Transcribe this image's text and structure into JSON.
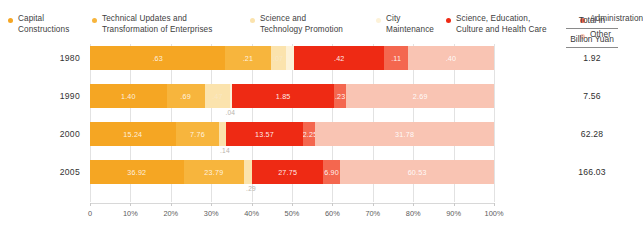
{
  "legend": {
    "items": [
      {
        "label": "Capital\nConstructions",
        "color": "#f5a623",
        "icon": "legend-dot"
      },
      {
        "label": "Technical Updates and\nTransformation of Enterprises",
        "color": "#f7b53d",
        "icon": "legend-dot"
      },
      {
        "label": "Science and\nTechnology Promotion",
        "color": "#fbe3ad",
        "icon": "legend-dot"
      },
      {
        "label": "City\nMaintenance",
        "color": "#fdf2d8",
        "icon": "legend-dot"
      },
      {
        "label": "Science, Education,\nCulture and Health Care",
        "color": "#ee2a14",
        "icon": "legend-dot"
      },
      {
        "label": "Administration",
        "color": "#f4674f",
        "icon": "legend-dot"
      },
      {
        "label": "Other",
        "color": "#f9c4b3",
        "icon": "legend-dot"
      }
    ]
  },
  "total_header": {
    "line1": "Total in",
    "line2": "Billion Yuan"
  },
  "axis": {
    "ticks": [
      "0",
      "10%",
      "20%",
      "30%",
      "40%",
      "50%",
      "60%",
      "70%",
      "80%",
      "90%",
      "100%"
    ],
    "values": [
      0,
      10,
      20,
      30,
      40,
      50,
      60,
      70,
      80,
      90,
      100
    ]
  },
  "chart_data": {
    "type": "bar",
    "subtype": "100% stacked horizontal bar",
    "title": "",
    "xlabel": "",
    "ylabel": "",
    "xlim": [
      0,
      100
    ],
    "grid": true,
    "legend_position": "top",
    "units": "Billion Yuan",
    "categories": [
      "1980",
      "1990",
      "2000",
      "2005"
    ],
    "series": [
      {
        "name": "Capital Constructions",
        "color": "#f5a623",
        "values": [
          0.63,
          1.4,
          15.24,
          36.92
        ],
        "labels": [
          ".63",
          "1.40",
          "15.24",
          "36.92"
        ]
      },
      {
        "name": "Technical Updates and Transformation of Enterprises",
        "color": "#f7b53d",
        "values": [
          0.21,
          0.69,
          7.76,
          23.79
        ],
        "labels": [
          ".21",
          ".69",
          "7.76",
          "23.79"
        ]
      },
      {
        "name": "Science and Technology Promotion",
        "color": "#fbe3ad",
        "values": [
          0.07,
          0.47,
          1.13,
          3.03
        ],
        "labels": [
          ".07",
          ".47",
          "1.13",
          "3.03"
        ]
      },
      {
        "name": "City Maintenance",
        "color": "#fdf2d8",
        "values": [
          0.04,
          0.04,
          0.14,
          0.29
        ],
        "labels": [
          "",
          ".04",
          ".14",
          ".29"
        ]
      },
      {
        "name": "Science, Education, Culture and Health Care",
        "color": "#ee2a14",
        "values": [
          0.42,
          1.85,
          13.57,
          27.75
        ],
        "labels": [
          ".42",
          "1.85",
          "13.57",
          "27.75"
        ]
      },
      {
        "name": "Administration",
        "color": "#f4674f",
        "values": [
          0.11,
          0.23,
          2.25,
          6.9
        ],
        "labels": [
          ".11",
          ".23",
          "2.25",
          "6.90"
        ]
      },
      {
        "name": "Other",
        "color": "#f9c4b3",
        "values": [
          0.4,
          2.69,
          31.78,
          60.53
        ],
        "labels": [
          ".40",
          "2.69",
          "31.78",
          "60.53"
        ]
      }
    ],
    "totals": [
      1.92,
      7.56,
      62.28,
      166.03
    ],
    "total_labels": [
      "1.92",
      "7.56",
      "62.28",
      "166.03"
    ]
  }
}
